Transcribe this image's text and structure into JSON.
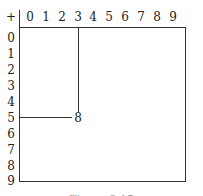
{
  "table": {
    "corner_symbol": "+",
    "column_headers": [
      "0",
      "1",
      "2",
      "3",
      "4",
      "5",
      "6",
      "7",
      "8",
      "9"
    ],
    "row_headers": [
      "0",
      "1",
      "2",
      "3",
      "4",
      "5",
      "6",
      "7",
      "8",
      "9"
    ],
    "highlight": {
      "row": "5",
      "column": "3",
      "result": "8"
    }
  },
  "caption": "Figure 2.15"
}
